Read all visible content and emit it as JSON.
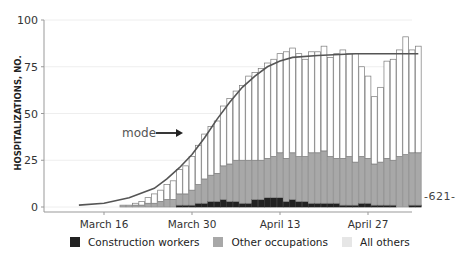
{
  "chart_data": {
    "type": "bar",
    "stacked": true,
    "title": "",
    "xlabel": "",
    "ylabel": "HOSPITALIZATIONS, NO.",
    "ylim": [
      0,
      100
    ],
    "yticks": [
      0,
      25,
      50,
      75,
      100
    ],
    "xtick_labels": [
      "March 16",
      "March 30",
      "April 13",
      "April 27"
    ],
    "xtick_day_index": [
      4,
      18,
      32,
      46
    ],
    "categories_start": "March 12",
    "colors": {
      "construction_workers": "#222222",
      "other_occupations": "#a8a8a8",
      "all_others": "#f2f2f2",
      "bar_edge": "#7a7a7a",
      "mode_curve": "#555555"
    },
    "series": [
      {
        "name": "Construction workers",
        "values": [
          0,
          0,
          0,
          0,
          0,
          0,
          0,
          0,
          0,
          0,
          0,
          0,
          0,
          0,
          0,
          0,
          1,
          1,
          1,
          2,
          2,
          3,
          3,
          4,
          3,
          3,
          2,
          2,
          4,
          4,
          5,
          5,
          5,
          3,
          4,
          3,
          3,
          2,
          2,
          2,
          2,
          2,
          1,
          1,
          1,
          2,
          2,
          1,
          1,
          1,
          1,
          0,
          0,
          1,
          1
        ]
      },
      {
        "name": "Other occupations",
        "values": [
          0,
          0,
          0,
          0,
          0,
          0,
          0,
          1,
          1,
          1,
          1,
          2,
          2,
          3,
          4,
          4,
          6,
          6,
          8,
          10,
          13,
          14,
          15,
          18,
          20,
          22,
          23,
          23,
          21,
          21,
          21,
          22,
          24,
          23,
          25,
          24,
          24,
          27,
          27,
          28,
          25,
          24,
          25,
          26,
          23,
          25,
          24,
          22,
          23,
          25,
          24,
          27,
          28,
          28,
          28
        ]
      },
      {
        "name": "All others",
        "values": [
          0,
          0,
          0,
          0,
          0,
          0,
          0,
          0,
          0,
          1,
          2,
          3,
          5,
          6,
          8,
          10,
          13,
          15,
          18,
          21,
          24,
          26,
          28,
          32,
          35,
          37,
          40,
          45,
          47,
          49,
          51,
          52,
          53,
          57,
          56,
          55,
          52,
          54,
          54,
          56,
          53,
          56,
          58,
          55,
          58,
          48,
          44,
          36,
          40,
          52,
          54,
          57,
          63,
          55,
          57
        ]
      }
    ],
    "totals": [
      1,
      1,
      1,
      1,
      1,
      1,
      1,
      1,
      1,
      2,
      3,
      5,
      7,
      9,
      12,
      14,
      20,
      22,
      27,
      33,
      39,
      43,
      46,
      54,
      58,
      62,
      65,
      70,
      72,
      74,
      77,
      79,
      82,
      83,
      85,
      82,
      79,
      83,
      83,
      86,
      80,
      82,
      84,
      82,
      82,
      75,
      70,
      59,
      64,
      78,
      79,
      84,
      91,
      84,
      86
    ],
    "mode_curve": {
      "label": "mode",
      "description": "logistic fit rising from ~0 in early March to plateau ~82 by mid-April",
      "points": [
        [
          0,
          1
        ],
        [
          4,
          2
        ],
        [
          8,
          5
        ],
        [
          12,
          10
        ],
        [
          14,
          15
        ],
        [
          16,
          21
        ],
        [
          18,
          28
        ],
        [
          20,
          37
        ],
        [
          22,
          47
        ],
        [
          24,
          56
        ],
        [
          26,
          64
        ],
        [
          28,
          70
        ],
        [
          30,
          75
        ],
        [
          32,
          78
        ],
        [
          34,
          80
        ],
        [
          38,
          81
        ],
        [
          44,
          82
        ],
        [
          54,
          82
        ]
      ]
    },
    "grid": true,
    "legend_position": "bottom"
  },
  "legend": {
    "items": [
      {
        "label": "Construction workers",
        "color": "#222222"
      },
      {
        "label": "Other occupations",
        "color": "#a8a8a8"
      },
      {
        "label": "All others",
        "color": "#ececec"
      }
    ]
  },
  "annotation": {
    "mode_label": "mode"
  },
  "side_note": "-621-",
  "axis": {
    "ylabel": "HOSPITALIZATIONS, NO.",
    "yticks": [
      "0",
      "25",
      "50",
      "75",
      "100"
    ],
    "xticks": [
      "March 16",
      "March 30",
      "April 13",
      "April 27"
    ]
  }
}
